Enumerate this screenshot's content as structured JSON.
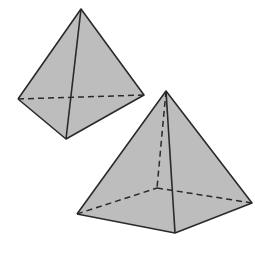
{
  "diagram": {
    "type": "geometric-solids",
    "fill_color": "#bdbdbd",
    "edge_color": "#2a2a2a",
    "background": "#ffffff",
    "shapes": [
      {
        "name": "triangular pyramid (tetrahedron)",
        "vertices": {
          "apex": [
            81,
            9
          ],
          "left": [
            18,
            99
          ],
          "right": [
            144,
            95
          ],
          "front": [
            66,
            139
          ]
        },
        "hidden_edges": [
          "left-right"
        ]
      },
      {
        "name": "square pyramid",
        "vertices": {
          "apex": [
            166,
            91
          ],
          "left": [
            77,
            214
          ],
          "front": [
            175,
            233
          ],
          "right": [
            252,
            203
          ],
          "back": [
            157,
            188
          ]
        },
        "hidden_edges": [
          "apex-back",
          "left-back",
          "back-right"
        ]
      }
    ]
  }
}
